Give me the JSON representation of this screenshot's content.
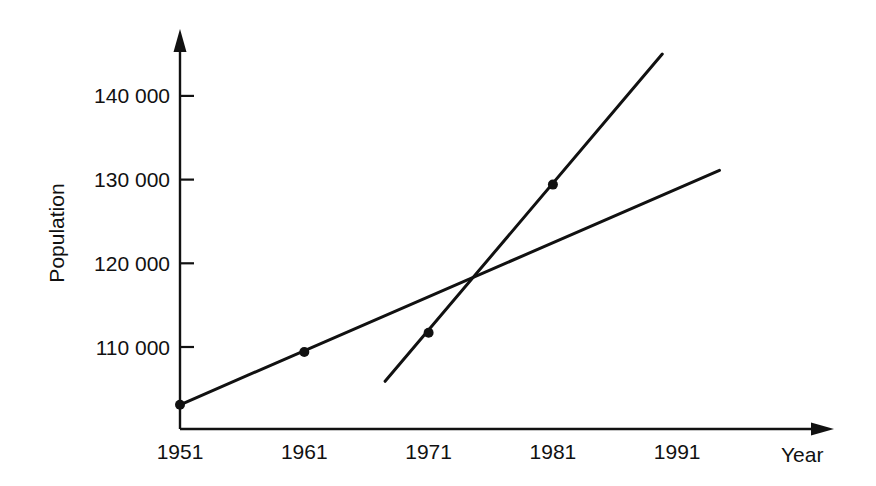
{
  "chart_data": {
    "type": "line",
    "title": "",
    "xlabel": "Year",
    "ylabel": "Population",
    "x_ticks": [
      "1951",
      "1961",
      "1971",
      "1981",
      "1991"
    ],
    "y_ticks": [
      "110 000",
      "120 000",
      "130 000",
      "140 000"
    ],
    "xlim": [
      1951,
      1998
    ],
    "ylim": [
      100000,
      146000
    ],
    "grid": false,
    "legend": null,
    "colors": {
      "line": "#111111",
      "axis": "#111111",
      "background": "#ffffff"
    },
    "series": [
      {
        "name": "Linear trend (1951–1961)",
        "points": [
          {
            "x": 1951,
            "y": 103100
          },
          {
            "x": 1961,
            "y": 109400
          }
        ],
        "line_extent": {
          "x_start": 1951,
          "y_start": 103100,
          "x_end": 1994.4,
          "y_end": 131100
        }
      },
      {
        "name": "Linear trend (1971–1981)",
        "points": [
          {
            "x": 1971,
            "y": 111700
          },
          {
            "x": 1981,
            "y": 129400
          }
        ],
        "line_extent": {
          "x_start": 1967.5,
          "y_start": 105900,
          "x_end": 1989.8,
          "y_end": 145000
        }
      }
    ],
    "annotations": [
      {
        "type": "intersection",
        "x": 1974.8,
        "y": 118300
      }
    ]
  }
}
